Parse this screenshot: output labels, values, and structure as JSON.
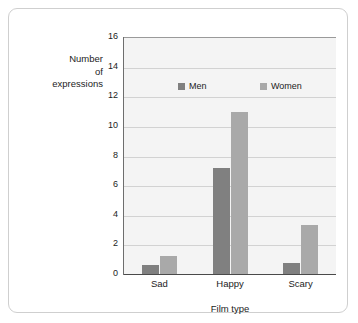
{
  "chart_data": {
    "type": "bar",
    "title": "",
    "categories": [
      "Sad",
      "Happy",
      "Scary"
    ],
    "series": [
      {
        "name": "Men",
        "values": [
          0.7,
          7.2,
          0.8
        ],
        "color": "#808080"
      },
      {
        "name": "Women",
        "values": [
          1.3,
          11.0,
          3.4
        ],
        "color": "#a9a9a9"
      }
    ],
    "xlabel": "Film type",
    "ylabel": "Number of expressions",
    "ylabel_lines": [
      "Number",
      "of",
      "expressions"
    ],
    "ylim": [
      0,
      16
    ],
    "ytick_step": 2,
    "yticks": [
      16,
      14,
      12,
      10,
      8,
      6,
      4,
      2,
      0
    ],
    "ytick_labels": [
      "16",
      "14",
      "12",
      "10",
      "8",
      "6",
      "4",
      "2",
      "0"
    ],
    "grid": true,
    "grid_axis": "y",
    "legend": {
      "position": "inside-top",
      "entries": [
        {
          "label": "Men",
          "color": "#808080"
        },
        {
          "label": "Women",
          "color": "#a9a9a9"
        }
      ]
    },
    "plot_background": "#f4f4f4",
    "frame_border_color": "#cfcfcf"
  }
}
